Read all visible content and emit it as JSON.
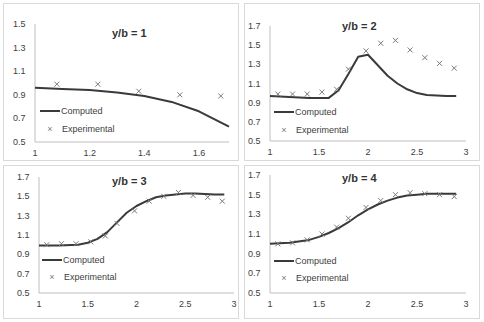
{
  "chart_data": [
    {
      "type": "line",
      "title": "y/b = 1",
      "xlabel": "",
      "ylabel": "",
      "xlim": [
        1,
        1.71
      ],
      "ylim": [
        0.5,
        1.5
      ],
      "xticks": [
        1,
        1.2,
        1.4,
        1.6
      ],
      "yticks": [
        0.5,
        0.7,
        0.9,
        1.1,
        1.3,
        1.5
      ],
      "grid": false,
      "legend": [
        "Computed",
        "Experimental"
      ],
      "legend_position": "lower-left",
      "series": [
        {
          "name": "Computed",
          "style": "line",
          "x": [
            1.0,
            1.1,
            1.2,
            1.3,
            1.4,
            1.5,
            1.6,
            1.71
          ],
          "y": [
            0.96,
            0.95,
            0.94,
            0.92,
            0.89,
            0.84,
            0.76,
            0.63
          ]
        },
        {
          "name": "Experimental",
          "style": "marker-x",
          "x": [
            1.08,
            1.23,
            1.38,
            1.53,
            1.68
          ],
          "y": [
            0.99,
            0.99,
            0.93,
            0.9,
            0.89
          ]
        }
      ]
    },
    {
      "type": "line",
      "title": "y/b = 2",
      "xlabel": "",
      "ylabel": "",
      "xlim": [
        1,
        3
      ],
      "ylim": [
        0.5,
        1.7
      ],
      "xticks": [
        1,
        1.5,
        2,
        2.5,
        3
      ],
      "yticks": [
        0.5,
        0.7,
        0.9,
        1.1,
        1.3,
        1.5,
        1.7
      ],
      "grid": false,
      "legend": [
        "Computed",
        "Experimental"
      ],
      "legend_position": "lower-left",
      "series": [
        {
          "name": "Computed",
          "style": "line",
          "x": [
            1.0,
            1.2,
            1.4,
            1.6,
            1.7,
            1.8,
            1.9,
            2.0,
            2.1,
            2.2,
            2.3,
            2.4,
            2.5,
            2.6,
            2.8,
            2.9
          ],
          "y": [
            0.97,
            0.96,
            0.95,
            0.95,
            1.03,
            1.2,
            1.38,
            1.4,
            1.29,
            1.18,
            1.1,
            1.04,
            1.0,
            0.98,
            0.97,
            0.97
          ]
        },
        {
          "name": "Experimental",
          "style": "marker-x",
          "x": [
            1.08,
            1.23,
            1.38,
            1.53,
            1.68,
            1.8,
            1.98,
            2.13,
            2.28,
            2.43,
            2.58,
            2.73,
            2.88
          ],
          "y": [
            0.99,
            0.99,
            0.99,
            1.01,
            1.04,
            1.25,
            1.44,
            1.52,
            1.55,
            1.45,
            1.37,
            1.31,
            1.26
          ]
        }
      ]
    },
    {
      "type": "line",
      "title": "y/b = 3",
      "xlabel": "",
      "ylabel": "",
      "xlim": [
        1,
        3
      ],
      "ylim": [
        0.5,
        1.7
      ],
      "xticks": [
        1,
        1.5,
        2,
        2.5,
        3
      ],
      "yticks": [
        0.5,
        0.7,
        0.9,
        1.1,
        1.3,
        1.5,
        1.7
      ],
      "grid": false,
      "legend": [
        "Computed",
        "Experimental"
      ],
      "legend_position": "lower-left",
      "series": [
        {
          "name": "Computed",
          "style": "line",
          "x": [
            1.0,
            1.2,
            1.4,
            1.5,
            1.6,
            1.7,
            1.8,
            1.9,
            2.0,
            2.1,
            2.2,
            2.3,
            2.4,
            2.5,
            2.6,
            2.8,
            2.9
          ],
          "y": [
            0.99,
            0.99,
            1.0,
            1.02,
            1.06,
            1.13,
            1.23,
            1.33,
            1.4,
            1.45,
            1.49,
            1.51,
            1.52,
            1.53,
            1.53,
            1.52,
            1.52
          ]
        },
        {
          "name": "Experimental",
          "style": "marker-x",
          "x": [
            1.08,
            1.23,
            1.38,
            1.53,
            1.68,
            1.8,
            1.98,
            2.13,
            2.28,
            2.43,
            2.58,
            2.73,
            2.88
          ],
          "y": [
            1.0,
            1.01,
            1.01,
            1.03,
            1.09,
            1.22,
            1.35,
            1.45,
            1.5,
            1.54,
            1.51,
            1.49,
            1.45
          ]
        }
      ]
    },
    {
      "type": "line",
      "title": "y/b = 4",
      "xlabel": "",
      "ylabel": "",
      "xlim": [
        1,
        3
      ],
      "ylim": [
        0.5,
        1.7
      ],
      "xticks": [
        1,
        1.5,
        2,
        2.5,
        3
      ],
      "yticks": [
        0.5,
        0.7,
        0.9,
        1.1,
        1.3,
        1.5,
        1.7
      ],
      "grid": false,
      "legend": [
        "Computed",
        "Experimental"
      ],
      "legend_position": "lower-left",
      "series": [
        {
          "name": "Computed",
          "style": "line",
          "x": [
            1.0,
            1.2,
            1.4,
            1.5,
            1.6,
            1.7,
            1.8,
            1.9,
            2.0,
            2.1,
            2.2,
            2.3,
            2.4,
            2.5,
            2.6,
            2.8,
            2.9
          ],
          "y": [
            1.0,
            1.01,
            1.04,
            1.07,
            1.11,
            1.16,
            1.22,
            1.29,
            1.35,
            1.4,
            1.44,
            1.47,
            1.49,
            1.5,
            1.51,
            1.51,
            1.51
          ]
        },
        {
          "name": "Experimental",
          "style": "marker-x",
          "x": [
            1.08,
            1.23,
            1.38,
            1.53,
            1.68,
            1.8,
            1.98,
            2.13,
            2.28,
            2.43,
            2.58,
            2.73,
            2.88
          ],
          "y": [
            1.0,
            1.01,
            1.04,
            1.1,
            1.17,
            1.26,
            1.37,
            1.44,
            1.5,
            1.52,
            1.51,
            1.5,
            1.48
          ]
        }
      ]
    }
  ],
  "panels": [
    {
      "title": "y/b = 1",
      "legend_computed": "Computed",
      "legend_experimental": "Experimental"
    },
    {
      "title": "y/b = 2",
      "legend_computed": "Computed",
      "legend_experimental": "Experimental"
    },
    {
      "title": "y/b = 3",
      "legend_computed": "Computed",
      "legend_experimental": "Experimental"
    },
    {
      "title": "y/b = 4",
      "legend_computed": "Computed",
      "legend_experimental": "Experimental"
    }
  ],
  "colors": {
    "line": "#3a3a3a",
    "marker": "#7a7a7a",
    "axis": "#bfbfbf",
    "text": "#404040",
    "border": "#d9d9d9"
  }
}
